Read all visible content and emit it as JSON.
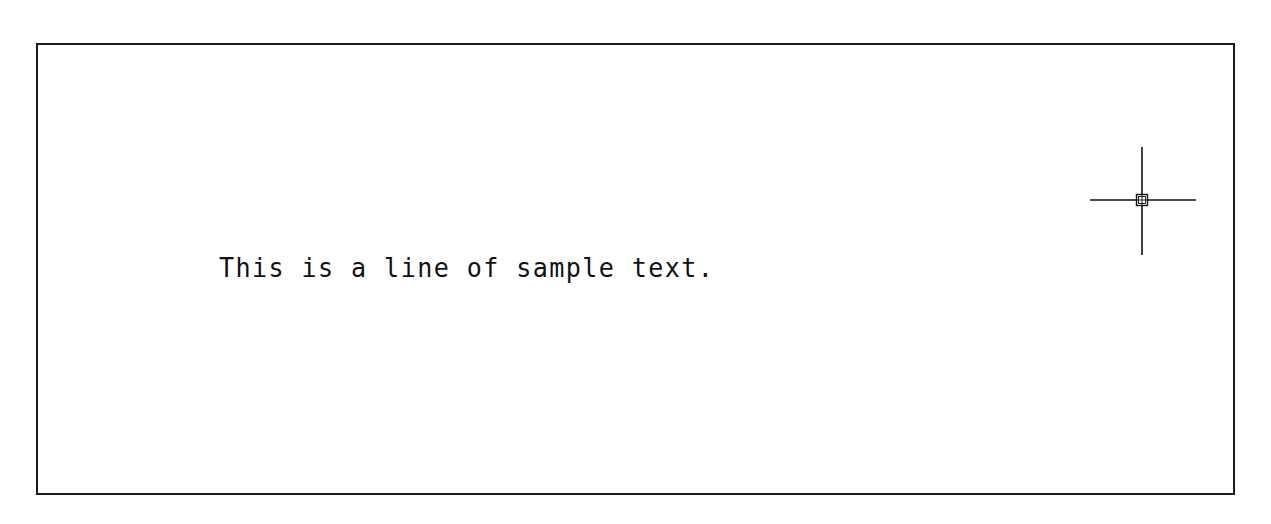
{
  "drawing": {
    "sample_text": "This is a line of sample text.",
    "frame_color": "#1a1a1a",
    "text_color": "#111111"
  },
  "cursor": {
    "icon": "crosshair-cursor-icon",
    "pickbox": "pickbox-icon"
  }
}
